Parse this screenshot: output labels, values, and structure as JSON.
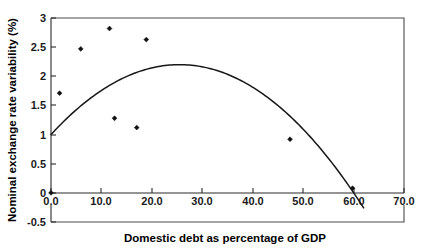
{
  "chart_data": {
    "type": "scatter",
    "title": "",
    "xlabel": "Domestic debt as percentage of GDP",
    "ylabel": "Nominal exchange rate variability (%)",
    "xlim": [
      -0.5,
      70.0
    ],
    "ylim": [
      -0.5,
      3.0
    ],
    "grid": false,
    "legend": "none",
    "xticks": [
      "0.0",
      "10.0",
      "20.0",
      "30.0",
      "40.0",
      "50.0",
      "60.0",
      "70.0"
    ],
    "xtick_values": [
      0,
      10,
      20,
      30,
      40,
      50,
      60,
      70
    ],
    "yticks": [
      "3",
      "2.5",
      "2",
      "1.5",
      "1",
      "0.5",
      "0",
      "-0.5"
    ],
    "ytick_values": [
      3,
      2.5,
      2,
      1.5,
      1,
      0.5,
      0,
      -0.5
    ],
    "series": [
      {
        "name": "observations",
        "marker": "diamond",
        "color": "#111111",
        "points": [
          {
            "x": 0.0,
            "y": 0.0
          },
          {
            "x": 1.7,
            "y": 1.71
          },
          {
            "x": 5.9,
            "y": 2.47
          },
          {
            "x": 11.6,
            "y": 2.82
          },
          {
            "x": 12.6,
            "y": 1.28
          },
          {
            "x": 17.0,
            "y": 1.12
          },
          {
            "x": 18.9,
            "y": 2.63
          },
          {
            "x": 47.4,
            "y": 0.92
          },
          {
            "x": 59.8,
            "y": 0.08
          }
        ]
      },
      {
        "name": "quadratic-fit",
        "marker": "none",
        "color": "#171717",
        "curve": {
          "form": "quadratic",
          "vertex_x": 25.5,
          "vertex_y": 2.2,
          "x_start": 0.0,
          "y_start": 1.0,
          "x_end": 62.0,
          "y_end": -0.18
        }
      }
    ]
  },
  "axes": {
    "x_title": "Domestic debt as percentage of GDP",
    "y_title": "Nominal exchange rate variability (%)"
  }
}
